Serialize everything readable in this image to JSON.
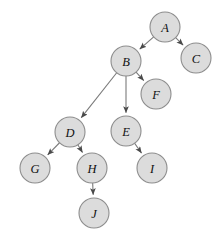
{
  "diagram": {
    "type": "directed-graph",
    "background_color": "#ffffff",
    "node_fill_color": "#dcdcdc",
    "node_stroke_color": "#8d8d8d",
    "edge_color": "#7a7a7a",
    "label_color": "#111111",
    "node_radius": 15,
    "nodes": [
      {
        "id": "A",
        "label": "A",
        "cx": 165,
        "cy": 27
      },
      {
        "id": "B",
        "label": "B",
        "cx": 126,
        "cy": 61
      },
      {
        "id": "C",
        "label": "C",
        "cx": 196,
        "cy": 58
      },
      {
        "id": "F",
        "label": "F",
        "cx": 156,
        "cy": 94
      },
      {
        "id": "D",
        "label": "D",
        "cx": 70,
        "cy": 132
      },
      {
        "id": "E",
        "label": "E",
        "cx": 126,
        "cy": 131
      },
      {
        "id": "G",
        "label": "G",
        "cx": 35,
        "cy": 168
      },
      {
        "id": "H",
        "label": "H",
        "cx": 92,
        "cy": 168
      },
      {
        "id": "I",
        "label": "I",
        "cx": 152,
        "cy": 168
      },
      {
        "id": "J",
        "label": "J",
        "cx": 94,
        "cy": 213
      }
    ],
    "edges": [
      {
        "from": "A",
        "to": "B",
        "directed": true
      },
      {
        "from": "A",
        "to": "C",
        "directed": true
      },
      {
        "from": "B",
        "to": "D",
        "directed": true
      },
      {
        "from": "B",
        "to": "E",
        "directed": true
      },
      {
        "from": "B",
        "to": "F",
        "directed": true
      },
      {
        "from": "D",
        "to": "G",
        "directed": true
      },
      {
        "from": "D",
        "to": "H",
        "directed": true
      },
      {
        "from": "E",
        "to": "I",
        "directed": true
      },
      {
        "from": "H",
        "to": "J",
        "directed": true
      }
    ]
  }
}
